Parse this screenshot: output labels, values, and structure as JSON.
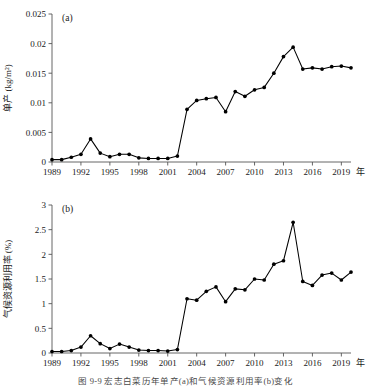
{
  "figure": {
    "caption": "图 9-9  宏志白菜历年单产(a)和气候资源利用率(b)变化",
    "panel_a_label": "(a)",
    "panel_b_label": "(b)"
  },
  "chart_data": [
    {
      "type": "line",
      "panel": "(a)",
      "title": "",
      "xlabel": "年",
      "ylabel": "单产 (kg/m²)",
      "ylim": [
        0,
        0.025
      ],
      "xlim": [
        1989,
        2020
      ],
      "yticks": [
        "0",
        "0.005",
        "0.01",
        "0.015",
        "0.02",
        "0.025"
      ],
      "ytick_values": [
        0,
        0.005,
        0.01,
        0.015,
        0.02,
        0.025
      ],
      "xticks": [
        "1989",
        "1992",
        "1995",
        "1998",
        "2001",
        "2004",
        "2007",
        "2010",
        "2013",
        "2016",
        "2019"
      ],
      "xtick_values": [
        1989,
        1992,
        1995,
        1998,
        2001,
        2004,
        2007,
        2010,
        2013,
        2016,
        2019
      ],
      "grid": false,
      "legend": false,
      "marker": "filled-circle",
      "color": "#000000",
      "x": [
        1989,
        1990,
        1991,
        1992,
        1993,
        1994,
        1995,
        1996,
        1997,
        1998,
        1999,
        2000,
        2001,
        2002,
        2003,
        2004,
        2005,
        2006,
        2007,
        2008,
        2009,
        2010,
        2011,
        2012,
        2013,
        2014,
        2015,
        2016,
        2017,
        2018,
        2019,
        2020
      ],
      "values": [
        0.0004,
        0.0004,
        0.0008,
        0.0013,
        0.0039,
        0.0015,
        0.0009,
        0.0013,
        0.0013,
        0.0007,
        0.0006,
        0.0006,
        0.0006,
        0.001,
        0.0089,
        0.0104,
        0.0107,
        0.0109,
        0.0085,
        0.0119,
        0.0111,
        0.0122,
        0.0126,
        0.015,
        0.0178,
        0.0194,
        0.0157,
        0.0159,
        0.0157,
        0.0161,
        0.0162,
        0.0159
      ]
    },
    {
      "type": "line",
      "panel": "(b)",
      "title": "",
      "xlabel": "年",
      "ylabel": "气候资源利用率 (%)",
      "ylim": [
        0,
        3
      ],
      "xlim": [
        1989,
        2020
      ],
      "yticks": [
        "0",
        "0.5",
        "1",
        "1.5",
        "2",
        "2.5",
        "3"
      ],
      "ytick_values": [
        0,
        0.5,
        1,
        1.5,
        2,
        2.5,
        3
      ],
      "xticks": [
        "1989",
        "1992",
        "1995",
        "1998",
        "2001",
        "2004",
        "2007",
        "2010",
        "2013",
        "2016",
        "2019"
      ],
      "xtick_values": [
        1989,
        1992,
        1995,
        1998,
        2001,
        2004,
        2007,
        2010,
        2013,
        2016,
        2019
      ],
      "grid": false,
      "legend": false,
      "marker": "filled-circle",
      "color": "#000000",
      "x": [
        1989,
        1990,
        1991,
        1992,
        1993,
        1994,
        1995,
        1996,
        1997,
        1998,
        1999,
        2000,
        2001,
        2002,
        2003,
        2004,
        2005,
        2006,
        2007,
        2008,
        2009,
        2010,
        2011,
        2012,
        2013,
        2014,
        2015,
        2016,
        2017,
        2018,
        2019,
        2020
      ],
      "values": [
        0.03,
        0.03,
        0.05,
        0.12,
        0.35,
        0.19,
        0.09,
        0.18,
        0.12,
        0.06,
        0.05,
        0.05,
        0.04,
        0.07,
        1.1,
        1.07,
        1.25,
        1.34,
        1.04,
        1.3,
        1.28,
        1.5,
        1.48,
        1.8,
        1.87,
        2.65,
        1.45,
        1.37,
        1.58,
        1.62,
        1.48,
        1.64
      ]
    }
  ]
}
